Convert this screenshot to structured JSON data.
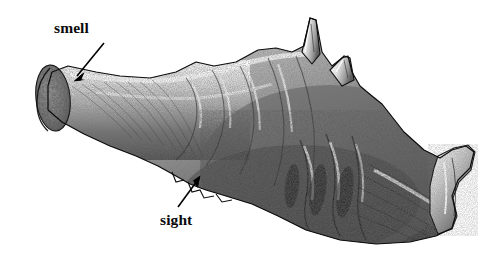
{
  "figure": {
    "domain": "scientific-illustration",
    "technique": "stipple / engraving, grayscale pen-and-ink",
    "background_color": "#ffffff",
    "ink_color": "#0b0b0b",
    "width": 491,
    "height": 261
  },
  "annotations": [
    {
      "id": "smell",
      "label": "smell",
      "label_x": 54,
      "label_y": 20,
      "arrow": {
        "tail_x": 104,
        "tail_y": 43,
        "head_x": 74,
        "head_y": 80
      }
    },
    {
      "id": "sight",
      "label": "sight",
      "label_x": 160,
      "label_y": 212,
      "arrow": {
        "tail_x": 178,
        "tail_y": 207,
        "head_x": 199,
        "head_y": 177
      }
    }
  ],
  "chart_data": {
    "type": "scatter",
    "title": "",
    "xlabel": "",
    "ylabel": "",
    "outline_path": "M 48,86 L 52,72 L 68,66 L 96,72 L 120,76 L 150,78 L 176,72 L 196,62 L 214,66 L 236,62 L 258,50 L 276,48 L 292,52 L 304,46 L 310,18 L 316,20 L 322,52 L 332,66 L 342,58 L 348,56 L 352,72 L 360,86 L 372,96 L 382,104 L 404,132 L 424,150 L 440,158 L 452,150 L 466,146 L 474,152 L 470,168 L 458,180 L 452,196 L 456,214 L 452,228 L 436,236 L 410,242 L 376,244 L 340,240 L 306,230 L 278,216 L 252,204 L 226,196 L 206,190 L 190,184 L 176,176 L 158,166 L 136,156 L 110,146 L 84,134 L 62,122 L 48,110 Z",
    "landmarks": [
      {
        "name": "olfactory-bulb-section",
        "x": 52,
        "y": 100
      },
      {
        "name": "olfactory-stalk",
        "x": 110,
        "y": 110
      },
      {
        "name": "cerebral-hemisphere",
        "x": 210,
        "y": 110
      },
      {
        "name": "optic-region",
        "x": 200,
        "y": 180
      },
      {
        "name": "dorsal-spike-anterior",
        "x": 312,
        "y": 30
      },
      {
        "name": "dorsal-spike-posterior",
        "x": 348,
        "y": 68
      },
      {
        "name": "posterior-flare",
        "x": 450,
        "y": 190
      }
    ]
  }
}
